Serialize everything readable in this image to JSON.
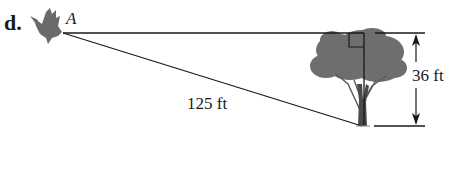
{
  "problem": {
    "label": "d."
  },
  "points": {
    "observer": "A"
  },
  "measurements": {
    "line_of_sight": "125 ft",
    "tree_height": "36 ft"
  },
  "colors": {
    "line": "#1a1a1a",
    "tree_foliage": "#6e6e6e",
    "tree_trunk": "#4a4a4a",
    "bird": "#6a6a6a",
    "text": "#1a1a1a"
  }
}
